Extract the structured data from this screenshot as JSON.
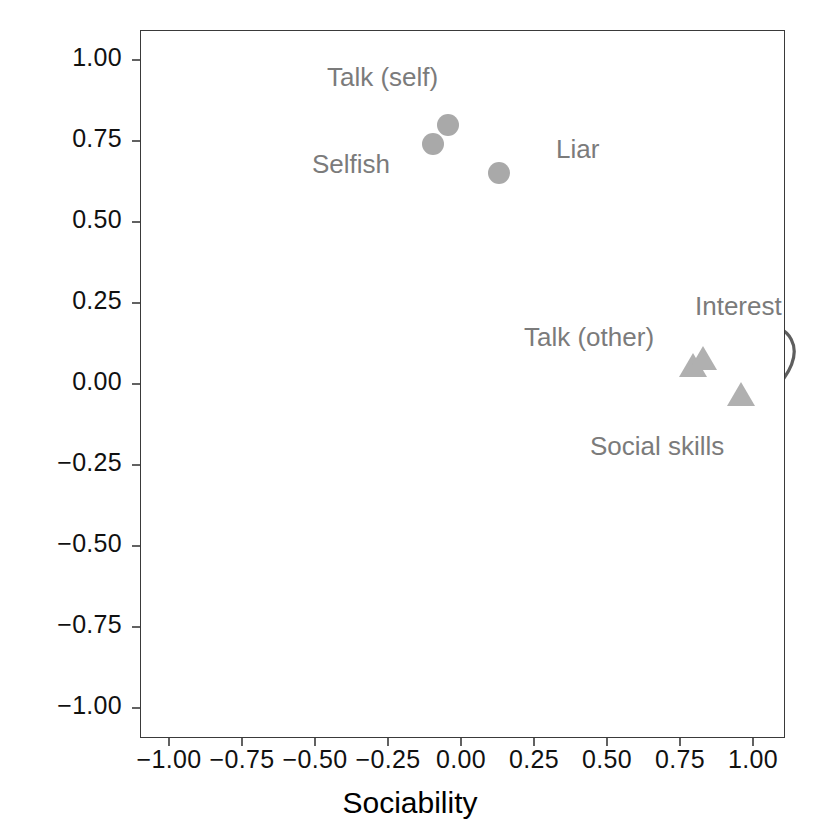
{
  "chart_data": {
    "type": "scatter",
    "title": "",
    "xlabel": "Sociability",
    "ylabel": "Inconsideration",
    "xlim": [
      -1.12,
      1.12
    ],
    "ylim": [
      -1.12,
      1.12
    ],
    "grid": true,
    "legend": "none",
    "xticks": [
      "-1.00",
      "-0.75",
      "-0.50",
      "-0.25",
      "0.00",
      "0.25",
      "0.50",
      "0.75",
      "1.00"
    ],
    "xtick_values": [
      -1.0,
      -0.75,
      -0.5,
      -0.25,
      0.0,
      0.25,
      0.5,
      0.75,
      1.0
    ],
    "yticks": [
      "1.00",
      "0.75",
      "0.50",
      "0.25",
      "0.00",
      "-0.25",
      "-0.50",
      "-0.75",
      "-1.00"
    ],
    "ytick_values": [
      1.0,
      0.75,
      0.5,
      0.25,
      0.0,
      -0.25,
      -0.5,
      -0.75,
      -1.0
    ],
    "reference_lines": [
      {
        "axis": "x",
        "value": 0.0
      },
      {
        "axis": "y",
        "value": 0.0
      }
    ],
    "series": [
      {
        "name": "Inconsideration cluster",
        "marker": "circle",
        "color": "#a9a9a9",
        "points": [
          {
            "label": "Talk (self)",
            "x": -0.045,
            "y": 0.8
          },
          {
            "label": "Selfish",
            "x": -0.095,
            "y": 0.74
          },
          {
            "label": "Liar",
            "x": 0.13,
            "y": 0.65
          }
        ]
      },
      {
        "name": "Sociability cluster",
        "marker": "triangle",
        "color": "#b0b0b0",
        "points": [
          {
            "label": "Talk (other)",
            "x": 0.795,
            "y": 0.05
          },
          {
            "label": "Interest",
            "x": 0.83,
            "y": 0.07
          },
          {
            "label": "Social skills",
            "x": 0.96,
            "y": -0.04
          }
        ]
      }
    ],
    "ellipses": [
      {
        "name": "upper-left-cluster-ellipse",
        "cx": -0.02,
        "cy": 0.725,
        "rx": 0.3,
        "ry": 0.155,
        "rotation": -24
      },
      {
        "name": "lower-right-cluster-ellipse",
        "cx": 0.875,
        "cy": 0.015,
        "rx": 0.29,
        "ry": 0.135,
        "rotation": -28
      }
    ],
    "annotations": [
      {
        "text": "Talk (self)",
        "x": 327,
        "y": 62,
        "leader_from": [
          400,
          95
        ],
        "leader_to": [
          444,
          121
        ]
      },
      {
        "text": "Selfish",
        "x": 312,
        "y": 149,
        "leader_from": [
          390,
          162
        ],
        "leader_to": [
          430,
          148
        ]
      },
      {
        "text": "Liar",
        "x": 556,
        "y": 134,
        "leader_from": [
          548,
          153
        ],
        "leader_to": [
          504,
          172
        ]
      },
      {
        "text": "Interest",
        "x": 695,
        "y": 291,
        "leader_from": [
          736,
          323
        ],
        "leader_to": [
          707,
          368
        ]
      },
      {
        "text": "Talk (other)",
        "x": 524,
        "y": 322,
        "leader_from": [
          650,
          352
        ],
        "leader_to": [
          692,
          372
        ]
      },
      {
        "text": "Social skills",
        "x": 590,
        "y": 431,
        "leader_from": [
          654,
          428
        ],
        "leader_to": [
          740,
          398
        ]
      }
    ]
  },
  "axes": {
    "x_title": "Sociability",
    "y_title": "Inconsideration"
  }
}
